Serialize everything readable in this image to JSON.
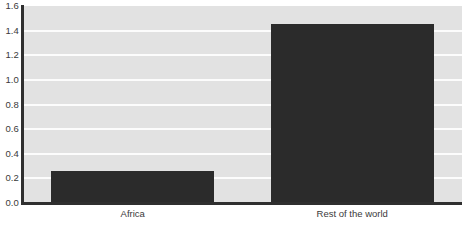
{
  "chart_data": {
    "type": "bar",
    "title": "",
    "subtitle": "",
    "xlabel": "",
    "ylabel": "",
    "categories": [
      "Africa",
      "Rest of the world"
    ],
    "values": [
      0.26,
      1.45
    ],
    "series": [
      {
        "name": "",
        "values": [
          0.26,
          1.45
        ],
        "color": "#2b2b2b"
      }
    ],
    "ylim": [
      0.0,
      1.6
    ],
    "ytick_labels": [
      "1.6",
      "1.4",
      "1.2",
      "1.0",
      "0.8",
      "0.6",
      "0.4",
      "0.2",
      "0.0"
    ],
    "ytick_values": [
      1.6,
      1.4,
      1.2,
      1.0,
      0.8,
      0.6,
      0.4,
      0.2,
      0.0
    ],
    "ytick_step": 0.2,
    "grid": true,
    "grid_axis": "y",
    "legend": false,
    "legend_position": "none",
    "annotations": []
  },
  "style": {
    "plot_background": "#e2e2e2",
    "gridline_color": "#fcfcfc",
    "axis_color": "#2f2f2f",
    "bar_color": "#2b2b2b",
    "tick_label_color": "#3a3a3a",
    "figure_background": "#ffffff"
  }
}
